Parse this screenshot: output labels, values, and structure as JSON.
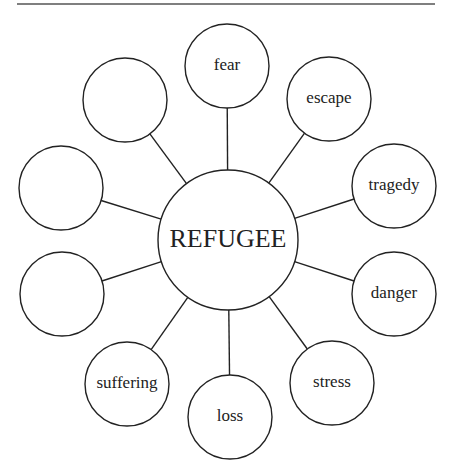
{
  "diagram": {
    "type": "word-web",
    "center": {
      "label": "REFUGEE",
      "cx": 228,
      "cy": 240,
      "r": 70
    },
    "nodes": [
      {
        "label": "fear",
        "cx": 227,
        "cy": 66
      },
      {
        "label": "escape",
        "cx": 329,
        "cy": 99
      },
      {
        "label": "tragedy",
        "cx": 394,
        "cy": 186
      },
      {
        "label": "danger",
        "cx": 394,
        "cy": 294
      },
      {
        "label": "stress",
        "cx": 332,
        "cy": 383
      },
      {
        "label": "loss",
        "cx": 230,
        "cy": 417
      },
      {
        "label": "suffering",
        "cx": 127,
        "cy": 384
      },
      {
        "label": "",
        "cx": 62,
        "cy": 294
      },
      {
        "label": "",
        "cx": 61,
        "cy": 188
      },
      {
        "label": "",
        "cx": 125,
        "cy": 100
      }
    ],
    "node_radius": 42,
    "stroke_color": "#222222",
    "top_rule": {
      "x1": 17,
      "x2": 435,
      "y": 4
    }
  }
}
